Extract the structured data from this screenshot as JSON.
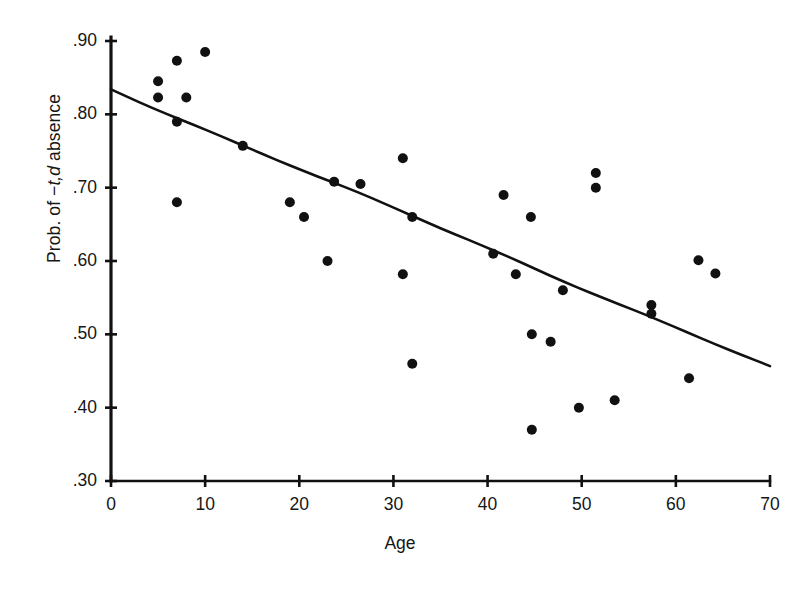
{
  "figure": {
    "background": "#ffffff",
    "ink_color": "#111111",
    "width": 808,
    "height": 590
  },
  "axis_label_y": {
    "prefix": "Prob. of −",
    "italic": "t,d",
    "suffix": " absence"
  },
  "chart_data": {
    "type": "scatter",
    "title": "",
    "xlabel": "Age",
    "ylabel": "Prob. of −t,d absence",
    "xlim": [
      0,
      70
    ],
    "ylim": [
      0.3,
      0.9
    ],
    "xticks": [
      0,
      10,
      20,
      30,
      40,
      50,
      60,
      70
    ],
    "xtick_labels": [
      "0",
      "10",
      "20",
      "30",
      "40",
      "50",
      "60",
      "70"
    ],
    "yticks": [
      0.3,
      0.4,
      0.5,
      0.6,
      0.7,
      0.8,
      0.9
    ],
    "ytick_labels": [
      ".30",
      ".40",
      ".50",
      ".60",
      ".70",
      ".80",
      ".90"
    ],
    "grid": false,
    "legend": "none",
    "marker": "filled-circle",
    "marker_color": "#111111",
    "points": [
      {
        "x": 5,
        "y": 0.845
      },
      {
        "x": 5,
        "y": 0.823
      },
      {
        "x": 7,
        "y": 0.873
      },
      {
        "x": 10,
        "y": 0.885
      },
      {
        "x": 8,
        "y": 0.823
      },
      {
        "x": 7,
        "y": 0.79
      },
      {
        "x": 7,
        "y": 0.68
      },
      {
        "x": 14,
        "y": 0.757
      },
      {
        "x": 19,
        "y": 0.68
      },
      {
        "x": 20.5,
        "y": 0.66
      },
      {
        "x": 23,
        "y": 0.6
      },
      {
        "x": 23.7,
        "y": 0.708
      },
      {
        "x": 26.5,
        "y": 0.705
      },
      {
        "x": 31,
        "y": 0.74
      },
      {
        "x": 31,
        "y": 0.582
      },
      {
        "x": 32,
        "y": 0.66
      },
      {
        "x": 32,
        "y": 0.46
      },
      {
        "x": 40.6,
        "y": 0.61
      },
      {
        "x": 41.7,
        "y": 0.69
      },
      {
        "x": 43,
        "y": 0.582
      },
      {
        "x": 44.6,
        "y": 0.66
      },
      {
        "x": 44.7,
        "y": 0.5
      },
      {
        "x": 44.7,
        "y": 0.37
      },
      {
        "x": 46.7,
        "y": 0.49
      },
      {
        "x": 48,
        "y": 0.56
      },
      {
        "x": 49.7,
        "y": 0.4
      },
      {
        "x": 51.5,
        "y": 0.72
      },
      {
        "x": 51.5,
        "y": 0.7
      },
      {
        "x": 53.5,
        "y": 0.41
      },
      {
        "x": 57.4,
        "y": 0.54
      },
      {
        "x": 57.4,
        "y": 0.528
      },
      {
        "x": 61.4,
        "y": 0.44
      },
      {
        "x": 62.4,
        "y": 0.601
      },
      {
        "x": 64.2,
        "y": 0.583
      }
    ],
    "trend_line": {
      "type": "regression-line",
      "x_start": 0,
      "y_start": 0.834,
      "x_end": 70,
      "y_end": 0.455
    }
  }
}
